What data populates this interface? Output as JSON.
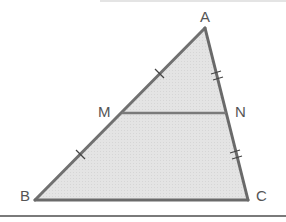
{
  "figure": {
    "type": "triangle-midsegment",
    "vertices": {
      "A": {
        "label": "A",
        "x": 205,
        "y": 28
      },
      "B": {
        "label": "B",
        "x": 35,
        "y": 200
      },
      "C": {
        "label": "C",
        "x": 248,
        "y": 200
      },
      "M": {
        "label": "M",
        "x": 122,
        "y": 113
      },
      "N": {
        "label": "N",
        "x": 226,
        "y": 113
      }
    },
    "segments": [
      "AB",
      "BC",
      "CA",
      "MN"
    ],
    "congruence_marks": {
      "AM": "single",
      "MB": "single",
      "AN": "double",
      "NC": "double"
    },
    "colors": {
      "fill": "#e3e3e3",
      "stroke": "#6e6e6e",
      "label": "#555555"
    }
  },
  "labels": {
    "A": "A",
    "B": "B",
    "C": "C",
    "M": "M",
    "N": "N"
  }
}
